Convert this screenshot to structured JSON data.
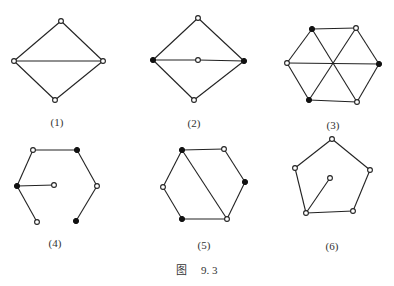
{
  "caption": {
    "prefix": "图",
    "number": "9. 3"
  },
  "figures": [
    {
      "label": "(1)",
      "label_pos": [
        57,
        116
      ],
      "nodes": [
        {
          "x": 61,
          "y": 21,
          "filled": false
        },
        {
          "x": 14,
          "y": 61,
          "filled": false
        },
        {
          "x": 103,
          "y": 61,
          "filled": false
        },
        {
          "x": 55,
          "y": 100,
          "filled": false
        }
      ],
      "edges": [
        [
          0,
          1
        ],
        [
          0,
          2
        ],
        [
          1,
          2
        ],
        [
          1,
          3
        ],
        [
          2,
          3
        ]
      ]
    },
    {
      "label": "(2)",
      "label_pos": [
        194,
        117
      ],
      "nodes": [
        {
          "x": 198,
          "y": 18,
          "filled": false
        },
        {
          "x": 153,
          "y": 60,
          "filled": true
        },
        {
          "x": 198,
          "y": 60,
          "filled": false
        },
        {
          "x": 244,
          "y": 61,
          "filled": true
        },
        {
          "x": 194,
          "y": 100,
          "filled": false
        }
      ],
      "edges": [
        [
          0,
          1
        ],
        [
          0,
          3
        ],
        [
          1,
          2
        ],
        [
          2,
          3
        ],
        [
          1,
          4
        ],
        [
          3,
          4
        ]
      ]
    },
    {
      "label": "(3)",
      "label_pos": [
        333,
        119
      ],
      "nodes": [
        {
          "x": 312,
          "y": 29,
          "filled": true
        },
        {
          "x": 356,
          "y": 28,
          "filled": false
        },
        {
          "x": 379,
          "y": 64,
          "filled": true
        },
        {
          "x": 357,
          "y": 102,
          "filled": false
        },
        {
          "x": 309,
          "y": 100,
          "filled": true
        },
        {
          "x": 287,
          "y": 63,
          "filled": false
        }
      ],
      "edges": [
        [
          0,
          1
        ],
        [
          1,
          2
        ],
        [
          2,
          3
        ],
        [
          3,
          4
        ],
        [
          4,
          5
        ],
        [
          5,
          0
        ],
        [
          0,
          3
        ],
        [
          1,
          4
        ],
        [
          2,
          5
        ]
      ]
    },
    {
      "label": "(4)",
      "label_pos": [
        55,
        237
      ],
      "nodes": [
        {
          "x": 33,
          "y": 150,
          "filled": false
        },
        {
          "x": 77,
          "y": 150,
          "filled": true
        },
        {
          "x": 97,
          "y": 186,
          "filled": false
        },
        {
          "x": 76,
          "y": 221,
          "filled": true
        },
        {
          "x": 37,
          "y": 222,
          "filled": false
        },
        {
          "x": 17,
          "y": 186,
          "filled": true
        },
        {
          "x": 54,
          "y": 185,
          "filled": false
        }
      ],
      "edges": [
        [
          0,
          1
        ],
        [
          1,
          2
        ],
        [
          2,
          3
        ],
        [
          0,
          5
        ],
        [
          5,
          4
        ],
        [
          5,
          6
        ]
      ]
    },
    {
      "label": "(5)",
      "label_pos": [
        204,
        239
      ],
      "nodes": [
        {
          "x": 182,
          "y": 150,
          "filled": true
        },
        {
          "x": 224,
          "y": 149,
          "filled": false
        },
        {
          "x": 245,
          "y": 182,
          "filled": true
        },
        {
          "x": 227,
          "y": 219,
          "filled": false
        },
        {
          "x": 182,
          "y": 219,
          "filled": true
        },
        {
          "x": 163,
          "y": 187,
          "filled": false
        }
      ],
      "edges": [
        [
          0,
          1
        ],
        [
          1,
          2
        ],
        [
          2,
          3
        ],
        [
          3,
          4
        ],
        [
          4,
          5
        ],
        [
          5,
          0
        ],
        [
          0,
          3
        ]
      ]
    },
    {
      "label": "(6)",
      "label_pos": [
        332,
        240
      ],
      "nodes": [
        {
          "x": 332,
          "y": 139,
          "filled": false
        },
        {
          "x": 370,
          "y": 170,
          "filled": false
        },
        {
          "x": 353,
          "y": 211,
          "filled": false
        },
        {
          "x": 306,
          "y": 213,
          "filled": false
        },
        {
          "x": 295,
          "y": 168,
          "filled": false
        },
        {
          "x": 330,
          "y": 178,
          "filled": false
        }
      ],
      "edges": [
        [
          0,
          1
        ],
        [
          1,
          2
        ],
        [
          2,
          3
        ],
        [
          3,
          4
        ],
        [
          4,
          0
        ],
        [
          3,
          5
        ]
      ]
    }
  ]
}
